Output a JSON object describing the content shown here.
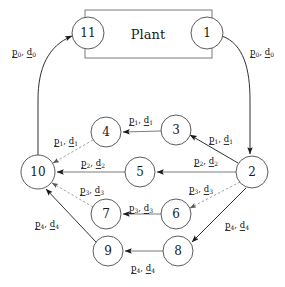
{
  "diagram": {
    "title": "Plant",
    "plant_box_label": "Plant",
    "nodes": [
      {
        "id": "n11",
        "label": "11",
        "cx": 88,
        "cy": 33,
        "r": 16
      },
      {
        "id": "n1",
        "label": "1",
        "cx": 207,
        "cy": 33,
        "r": 16
      },
      {
        "id": "n4",
        "label": "4",
        "cx": 106,
        "cy": 132,
        "r": 15
      },
      {
        "id": "n3",
        "label": "3",
        "cx": 176,
        "cy": 130,
        "r": 15
      },
      {
        "id": "n10",
        "label": "10",
        "cx": 38,
        "cy": 172,
        "r": 17
      },
      {
        "id": "n5",
        "label": "5",
        "cx": 140,
        "cy": 172,
        "r": 15
      },
      {
        "id": "n2",
        "label": "2",
        "cx": 252,
        "cy": 172,
        "r": 16
      },
      {
        "id": "n7",
        "label": "7",
        "cx": 106,
        "cy": 214,
        "r": 15
      },
      {
        "id": "n6",
        "label": "6",
        "cx": 176,
        "cy": 214,
        "r": 15
      },
      {
        "id": "n9",
        "label": "9",
        "cx": 108,
        "cy": 251,
        "r": 15
      },
      {
        "id": "n8",
        "label": "8",
        "cx": 178,
        "cy": 251,
        "r": 15
      }
    ],
    "edge_labels": [
      {
        "id": "lbl-p0-left",
        "p": "p",
        "d": "d",
        "sub": "0",
        "x": 24,
        "y": 52
      },
      {
        "id": "lbl-p0-right",
        "p": "p",
        "d": "d",
        "sub": "0",
        "x": 262,
        "y": 52
      },
      {
        "id": "lbl-p1-3to4",
        "p": "p",
        "d": "d",
        "sub": "1",
        "x": 141,
        "y": 120
      },
      {
        "id": "lbl-p1-4to10",
        "p": "p",
        "d": "d",
        "sub": "1",
        "x": 66,
        "y": 141
      },
      {
        "id": "lbl-p1-2to3",
        "p": "p",
        "d": "d",
        "sub": "1",
        "x": 221,
        "y": 139
      },
      {
        "id": "lbl-p2-5to10",
        "p": "p",
        "d": "d",
        "sub": "2",
        "x": 93,
        "y": 163
      },
      {
        "id": "lbl-p2-2to5",
        "p": "p",
        "d": "d",
        "sub": "2",
        "x": 206,
        "y": 161
      },
      {
        "id": "lbl-p3-7to10",
        "p": "p",
        "d": "d",
        "sub": "3",
        "x": 92,
        "y": 190
      },
      {
        "id": "lbl-p3-6to7",
        "p": "p",
        "d": "d",
        "sub": "3",
        "x": 141,
        "y": 208
      },
      {
        "id": "lbl-p3-2to6",
        "p": "p",
        "d": "d",
        "sub": "3",
        "x": 201,
        "y": 189
      },
      {
        "id": "lbl-p4-9to10",
        "p": "p",
        "d": "d",
        "sub": "4",
        "x": 47,
        "y": 224
      },
      {
        "id": "lbl-p4-8to9",
        "p": "p",
        "d": "d",
        "sub": "4",
        "x": 143,
        "y": 268
      },
      {
        "id": "lbl-p4-2to8",
        "p": "p",
        "d": "d",
        "sub": "4",
        "x": 237,
        "y": 225
      }
    ],
    "edges": [
      {
        "id": "edge-1-to-2",
        "from": "1",
        "to": "2",
        "style": "solid"
      },
      {
        "id": "edge-10-to-11",
        "from": "10",
        "to": "11",
        "style": "solid"
      },
      {
        "id": "edge-3-to-4",
        "from": "3",
        "to": "4",
        "style": "solid"
      },
      {
        "id": "edge-4-to-10",
        "from": "4",
        "to": "10",
        "style": "dashed"
      },
      {
        "id": "edge-2-to-3",
        "from": "2",
        "to": "3",
        "style": "solid"
      },
      {
        "id": "edge-5-to-10",
        "from": "5",
        "to": "10",
        "style": "solid"
      },
      {
        "id": "edge-2-to-5",
        "from": "2",
        "to": "5",
        "style": "solid"
      },
      {
        "id": "edge-7-to-10",
        "from": "7",
        "to": "10",
        "style": "dashed"
      },
      {
        "id": "edge-6-to-7",
        "from": "6",
        "to": "7",
        "style": "solid"
      },
      {
        "id": "edge-2-to-6",
        "from": "2",
        "to": "6",
        "style": "dashed"
      },
      {
        "id": "edge-9-to-10",
        "from": "9",
        "to": "10",
        "style": "solid"
      },
      {
        "id": "edge-8-to-9",
        "from": "8",
        "to": "9",
        "style": "solid"
      },
      {
        "id": "edge-2-to-8",
        "from": "2",
        "to": "8",
        "style": "solid"
      }
    ],
    "colors": {
      "stroke": "#1a1a1a",
      "light_stroke": "#8a8a8a",
      "text": "#1a1a1a",
      "background": "#ffffff"
    }
  }
}
